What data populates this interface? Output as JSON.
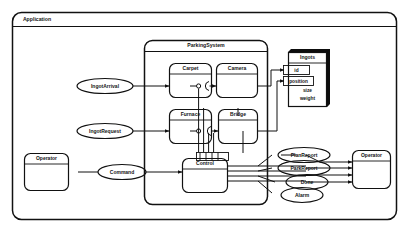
{
  "diagram": {
    "type": "uml-component-diagram",
    "frame": {
      "label": "Application"
    },
    "package": {
      "label": "ParkingSystem"
    },
    "components": [
      {
        "id": "carpet",
        "label": "Carpet"
      },
      {
        "id": "camera",
        "label": "Camera"
      },
      {
        "id": "furnace",
        "label": "Furnace"
      },
      {
        "id": "bridge",
        "label": "Bridge"
      },
      {
        "id": "control",
        "label": "Control"
      }
    ],
    "actors": [
      {
        "id": "operator_left",
        "label": "Operator"
      },
      {
        "id": "operator_right",
        "label": "Operator"
      }
    ],
    "class_box": {
      "name": "Ingots",
      "attributes": [
        "id",
        "position",
        "size",
        "weight"
      ]
    },
    "signals_in": [
      {
        "id": "ingot_arrival",
        "label": "IngotArrival"
      },
      {
        "id": "ingot_request",
        "label": "IngotRequest"
      },
      {
        "id": "command",
        "label": "Command"
      }
    ],
    "signals_out": [
      {
        "id": "plan_report",
        "label": "PlanReport"
      },
      {
        "id": "park_report",
        "label": "ParkReport"
      },
      {
        "id": "done",
        "label": "Done"
      },
      {
        "id": "alarm",
        "label": "Alarm"
      }
    ],
    "colors": {
      "stroke": "#111111",
      "frame_fill": "#ececed",
      "box_fill": "#ffffff",
      "shadow": "#0d0d0d"
    }
  }
}
